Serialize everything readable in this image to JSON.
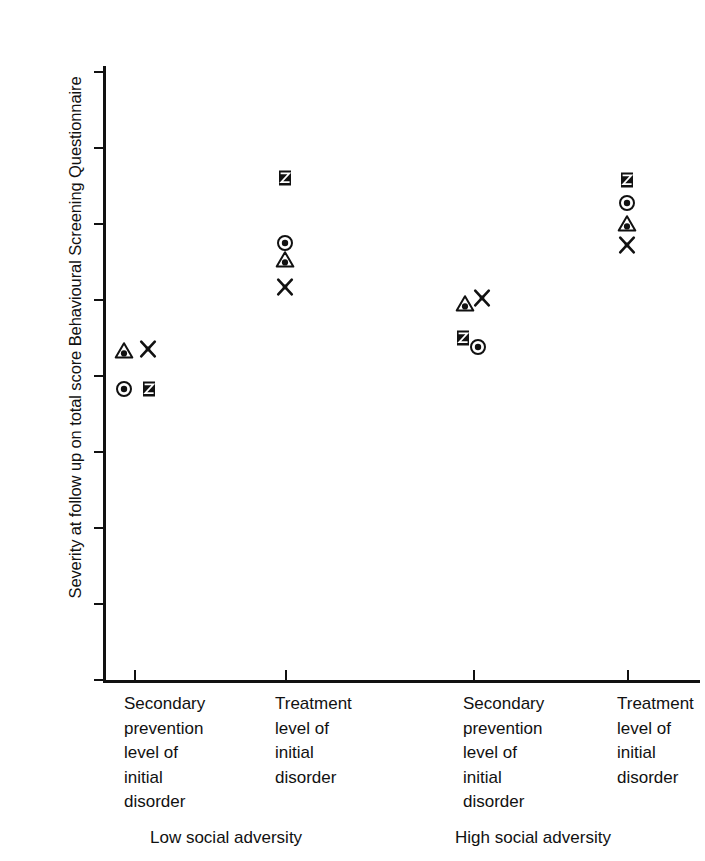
{
  "chart_data": {
    "type": "scatter",
    "title": "",
    "xlabel": "",
    "ylabel": "Severity at follow up on total score Behavioural Screening Questionnaire",
    "ylim": [
      0,
      16
    ],
    "ytick_labels": [
      "0",
      "2",
      "4",
      "6",
      "8",
      "10",
      "12",
      "14",
      "16"
    ],
    "ytick_values": [
      0,
      2,
      4,
      6,
      8,
      10,
      12,
      14,
      16
    ],
    "grid": false,
    "legend": "none",
    "categories": [
      "Secondary\nprevention\nlevel of\ninitial\ndisorder",
      "Treatment\nlevel of\ninitial\ndisorder",
      "Secondary\nprevention\nlevel of\ninitial\ndisorder",
      "Treatment\nlevel of\ninitial\ndisorder"
    ],
    "group_labels": [
      "Low social adversity",
      "High social adversity"
    ],
    "series": [
      {
        "name": "circle-dot",
        "marker": "circle-dot",
        "values": [
          7.6,
          11.45,
          8.7,
          12.5
        ]
      },
      {
        "name": "triangle-dot",
        "marker": "triangle-dot",
        "values": [
          8.6,
          11.0,
          9.85,
          11.95
        ]
      },
      {
        "name": "x-cross",
        "marker": "x-cross",
        "values": [
          8.65,
          10.3,
          10.0,
          11.4
        ]
      },
      {
        "name": "z-square",
        "marker": "z-square",
        "values": [
          7.6,
          13.15,
          8.95,
          13.1
        ]
      }
    ],
    "points": [
      {
        "cluster": 0,
        "marker": "triangle-dot",
        "value": 8.6,
        "dx": -10
      },
      {
        "cluster": 0,
        "marker": "x-cross",
        "value": 8.65,
        "dx": 14
      },
      {
        "cluster": 0,
        "marker": "circle-dot",
        "value": 7.6,
        "dx": -10
      },
      {
        "cluster": 0,
        "marker": "z-square",
        "value": 7.6,
        "dx": 15
      },
      {
        "cluster": 1,
        "marker": "z-square",
        "value": 13.15,
        "dx": 0
      },
      {
        "cluster": 1,
        "marker": "circle-dot",
        "value": 11.45,
        "dx": 0
      },
      {
        "cluster": 1,
        "marker": "triangle-dot",
        "value": 11.0,
        "dx": 0
      },
      {
        "cluster": 1,
        "marker": "x-cross",
        "value": 10.3,
        "dx": 0
      },
      {
        "cluster": 2,
        "marker": "triangle-dot",
        "value": 9.85,
        "dx": -8
      },
      {
        "cluster": 2,
        "marker": "x-cross",
        "value": 10.0,
        "dx": 9
      },
      {
        "cluster": 2,
        "marker": "z-square",
        "value": 8.95,
        "dx": -10
      },
      {
        "cluster": 2,
        "marker": "circle-dot",
        "value": 8.7,
        "dx": 5
      },
      {
        "cluster": 3,
        "marker": "z-square",
        "value": 13.1,
        "dx": 0
      },
      {
        "cluster": 3,
        "marker": "circle-dot",
        "value": 12.5,
        "dx": 0
      },
      {
        "cluster": 3,
        "marker": "triangle-dot",
        "value": 11.95,
        "dx": 0
      },
      {
        "cluster": 3,
        "marker": "x-cross",
        "value": 11.4,
        "dx": 0
      }
    ],
    "cluster_x_px": [
      31,
      182,
      370,
      524
    ],
    "colors": {
      "ink": "#111111",
      "background": "#ffffff"
    }
  }
}
